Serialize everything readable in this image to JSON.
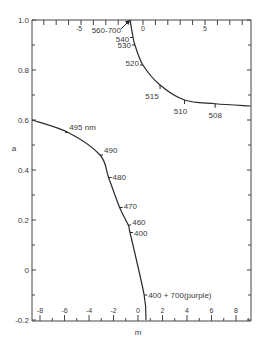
{
  "chart_data": {
    "type": "line",
    "title": "",
    "xlabel": "m",
    "ylabel": "a",
    "xlim": [
      -9,
      9.3
    ],
    "ylim": [
      -0.2,
      1.0
    ],
    "grid": false,
    "legend": null,
    "bottom_x_ticks": [
      -8,
      -6,
      -4,
      -2,
      0,
      2,
      4,
      6,
      8
    ],
    "top_x_ticks": [
      -5,
      0,
      5
    ],
    "y_ticks": [
      1.0,
      0.8,
      0.6,
      0.4,
      0.2,
      0,
      -0.2
    ],
    "y_tick_labels": [
      "1.0",
      "0.8",
      "0.6",
      "0.4",
      "0.2",
      "0",
      "-0.2"
    ],
    "series": [
      {
        "name": "upper branch",
        "points": [
          {
            "m": -0.65,
            "a": 1.0,
            "label": "560-700"
          },
          {
            "m": -0.4,
            "a": 0.93,
            "label": "540"
          },
          {
            "m": -0.25,
            "a": 0.9,
            "label": "530"
          },
          {
            "m": 0.4,
            "a": 0.82,
            "label": "520"
          },
          {
            "m": 1.8,
            "a": 0.74,
            "label": "515"
          },
          {
            "m": 3.8,
            "a": 0.68,
            "label": "510"
          },
          {
            "m": 6.3,
            "a": 0.665,
            "label": "508"
          },
          {
            "m": 9.2,
            "a": 0.656,
            "label": ""
          }
        ]
      },
      {
        "name": "lower branch",
        "points": [
          {
            "m": -8.65,
            "a": 0.6,
            "label": ""
          },
          {
            "m": -5.7,
            "a": 0.55,
            "label": "495 nm"
          },
          {
            "m": -3.1,
            "a": 0.46,
            "label": "490"
          },
          {
            "m": -2.4,
            "a": 0.37,
            "label": "480"
          },
          {
            "m": -1.5,
            "a": 0.25,
            "label": "470"
          },
          {
            "m": -0.8,
            "a": 0.18,
            "label": "460"
          },
          {
            "m": -0.65,
            "a": 0.15,
            "label": "400"
          },
          {
            "m": 0.5,
            "a": -0.1,
            "label": "400 + 700(purple)"
          },
          {
            "m": 0.65,
            "a": -0.2,
            "label": ""
          }
        ]
      }
    ],
    "annotations": [
      {
        "text": "560-700",
        "arrow_to": {
          "m": -0.65,
          "a": 1.0
        }
      }
    ]
  },
  "colors": {
    "line": "#2a2a2a",
    "text": "#3a3a3a",
    "background": "#ffffff"
  }
}
